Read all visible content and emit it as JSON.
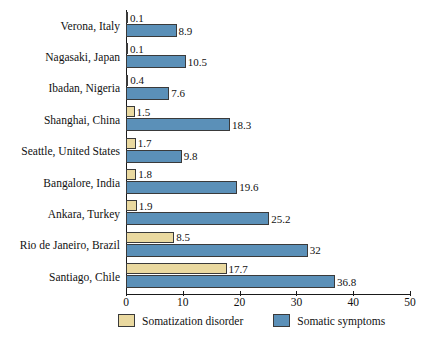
{
  "chart_data": {
    "type": "bar",
    "orientation": "horizontal",
    "title": "",
    "xlabel": "",
    "ylabel": "",
    "xlim": [
      0,
      50
    ],
    "xticks": [
      0,
      10,
      20,
      30,
      40,
      50
    ],
    "grid": false,
    "legend_position": "bottom",
    "categories": [
      "Verona, Italy",
      "Nagasaki, Japan",
      "Ibadan, Nigeria",
      "Shanghai, China",
      "Seattle, United States",
      "Bangalore, India",
      "Ankara, Turkey",
      "Rio de Janeiro, Brazil",
      "Santiago, Chile"
    ],
    "series": [
      {
        "name": "Somatization disorder",
        "color": "#ead9a0",
        "values": [
          0.1,
          0.1,
          0.4,
          1.5,
          1.7,
          1.8,
          1.9,
          8.5,
          17.7
        ]
      },
      {
        "name": "Somatic symptoms",
        "color": "#5b90b8",
        "values": [
          8.9,
          10.5,
          7.6,
          18.3,
          9.8,
          19.6,
          25.2,
          32,
          36.8
        ]
      }
    ]
  }
}
